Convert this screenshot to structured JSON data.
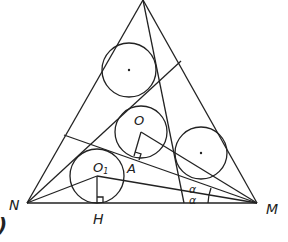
{
  "diagram": {
    "type": "geometry",
    "labels": {
      "N": "N",
      "M": "M",
      "H": "H",
      "O": "O",
      "O1_main": "O",
      "O1_sub": "1",
      "A": "A",
      "alpha_upper": "α",
      "alpha_lower": "α",
      "corner_fragment": ")"
    },
    "points": {
      "apex": [
        143,
        0
      ],
      "N": [
        27,
        203
      ],
      "M": [
        257,
        203
      ],
      "H": [
        97,
        203
      ],
      "A": [
        136,
        157
      ],
      "O": [
        141,
        132
      ],
      "O1": [
        97,
        176
      ]
    },
    "circles": [
      {
        "name": "top-circle",
        "cx": 129,
        "cy": 70,
        "r": 27,
        "center_dot": true
      },
      {
        "name": "circle-O",
        "cx": 141,
        "cy": 132,
        "r": 26,
        "center_dot": false
      },
      {
        "name": "circle-O1",
        "cx": 97,
        "cy": 176,
        "r": 27,
        "center_dot": false
      },
      {
        "name": "right-circle",
        "cx": 201,
        "cy": 153,
        "r": 26,
        "center_dot": true
      }
    ],
    "colors": {
      "stroke": "#222222",
      "background": "#ffffff"
    }
  }
}
